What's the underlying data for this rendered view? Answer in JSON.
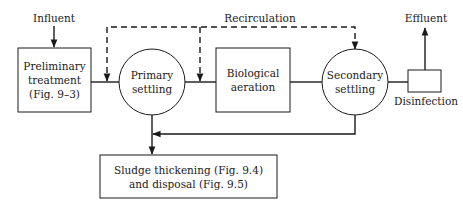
{
  "diagram": {
    "type": "process-flow",
    "labels": {
      "influent": "Influent",
      "recirculation": "Recirculation",
      "effluent": "Effluent",
      "disinfection": "Disinfection"
    },
    "nodes": [
      {
        "id": "preliminary",
        "shape": "rectangle",
        "lines": [
          "Preliminary",
          "treatment",
          "(Fig. 9–3)"
        ]
      },
      {
        "id": "primary",
        "shape": "circle",
        "lines": [
          "Primary",
          "settling"
        ]
      },
      {
        "id": "biological",
        "shape": "rectangle",
        "lines": [
          "Biological",
          "aeration"
        ]
      },
      {
        "id": "secondary",
        "shape": "circle",
        "lines": [
          "Secondary",
          "settling"
        ]
      },
      {
        "id": "disinfection",
        "shape": "small-rectangle",
        "lines": []
      },
      {
        "id": "sludge",
        "shape": "rectangle",
        "lines": [
          "Sludge thickening (Fig. 9.4)",
          "and disposal (Fig. 9.5)"
        ]
      }
    ],
    "edges": [
      {
        "from": "influent",
        "to": "preliminary",
        "style": "solid"
      },
      {
        "from": "preliminary",
        "to": "primary",
        "style": "solid"
      },
      {
        "from": "primary",
        "to": "biological",
        "style": "solid"
      },
      {
        "from": "biological",
        "to": "secondary",
        "style": "solid"
      },
      {
        "from": "secondary",
        "to": "disinfection",
        "style": "solid"
      },
      {
        "from": "disinfection",
        "to": "effluent",
        "style": "solid"
      },
      {
        "from": "secondary",
        "to": "preliminary-primary-link",
        "style": "dashed",
        "label": "Recirculation"
      },
      {
        "from": "secondary",
        "to": "primary-biological-link",
        "style": "dashed"
      },
      {
        "from": "primary",
        "to": "sludge",
        "style": "solid"
      },
      {
        "from": "secondary",
        "to": "sludge-line",
        "style": "solid"
      }
    ]
  }
}
